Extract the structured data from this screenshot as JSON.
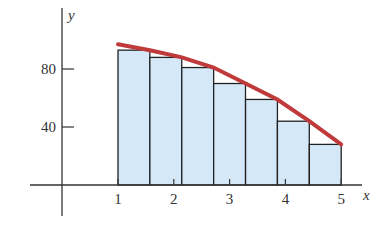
{
  "chart_data": {
    "type": "bar",
    "title": "",
    "xlabel": "x",
    "ylabel": "y",
    "x_ticks": [
      "1",
      "2",
      "3",
      "4",
      "5"
    ],
    "y_ticks": [
      "40",
      "80"
    ],
    "xlim": [
      0,
      5.4
    ],
    "ylim": [
      0,
      100
    ],
    "grid": false,
    "bars": {
      "left_edges": [
        1.0,
        1.571,
        2.143,
        2.714,
        3.286,
        3.857,
        4.429
      ],
      "width": 0.571,
      "heights": [
        93,
        88,
        81,
        70,
        59,
        44,
        28
      ]
    },
    "curve": {
      "x": [
        1,
        1.571,
        2.143,
        2.714,
        3.286,
        3.857,
        4.429,
        5
      ],
      "y": [
        97,
        93,
        88,
        81,
        70,
        59,
        44,
        28
      ]
    },
    "colors": {
      "bar_fill": "#d4e8f7",
      "bar_stroke": "#222222",
      "curve": "#c0393b",
      "axis": "#333333"
    }
  }
}
